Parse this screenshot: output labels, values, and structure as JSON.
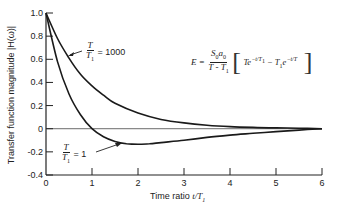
{
  "chart_data": {
    "type": "line",
    "title": "",
    "xlabel": "Time ratio t/T1",
    "ylabel": "Transfer function magnitude |H(ω)|",
    "xlim": [
      0,
      6
    ],
    "ylim": [
      -0.4,
      1.0
    ],
    "xticks": [
      0,
      1,
      2,
      3,
      4,
      5,
      6
    ],
    "yticks": [
      -0.4,
      -0.2,
      0,
      0.2,
      0.4,
      0.6,
      0.8,
      1.0
    ],
    "ytick_labels": [
      "-0.4",
      "-0.2",
      "0",
      "0.2",
      "0.4",
      "0.6",
      "0.8",
      "1.0"
    ],
    "grid": false,
    "zero_line": true,
    "series": [
      {
        "name": "T/T1 = 1000",
        "x": [
          0,
          0.25,
          0.5,
          0.75,
          1.0,
          1.25,
          1.5,
          2.0,
          2.5,
          3.0,
          3.5,
          4.0,
          4.5,
          5.0,
          5.5,
          6.0
        ],
        "values": [
          1.0,
          0.78,
          0.61,
          0.47,
          0.37,
          0.29,
          0.22,
          0.135,
          0.08,
          0.05,
          0.03,
          0.018,
          0.011,
          0.007,
          0.004,
          0.0
        ]
      },
      {
        "name": "T/T1 = 1",
        "x": [
          0,
          0.25,
          0.5,
          0.75,
          1.0,
          1.25,
          1.5,
          1.75,
          2.0,
          2.25,
          2.5,
          3.0,
          3.5,
          4.0,
          4.5,
          5.0,
          5.5,
          6.0
        ],
        "values": [
          1.0,
          0.58,
          0.3,
          0.12,
          0.0,
          -0.07,
          -0.11,
          -0.13,
          -0.135,
          -0.13,
          -0.12,
          -0.1,
          -0.075,
          -0.055,
          -0.04,
          -0.025,
          -0.012,
          0.0
        ]
      }
    ],
    "annotations": [
      {
        "text": "T/T1 = 1000",
        "points_to": "upper curve near t/T1 ≈ 0.6"
      },
      {
        "text": "T/T1 = 1",
        "points_to": "lower curve near t/T1 ≈ 1.7"
      },
      {
        "text": "E = (S0 a0 / (T - T1)) [ T e^(-t/T1) - T1 e^(-t/T) ]"
      }
    ]
  },
  "labels": {
    "ylabel": "Transfer function magnitude |H(ω)|",
    "xlabel_prefix": "Time ratio ",
    "xlabel_var": "t/T",
    "xlabel_sub": "1",
    "curve1": {
      "num": "T",
      "den": "T",
      "den_sub": "1",
      "eq": "= 1000"
    },
    "curve2": {
      "num": "T",
      "den": "T",
      "den_sub": "1",
      "eq": "= 1"
    },
    "formula": {
      "lhs": "E =",
      "num": "S",
      "num_sub1": "0",
      "num_mid": "a",
      "num_sub2": "0",
      "den": "T - T",
      "den_sub": "1",
      "term1": "Te",
      "term1_sup": "−t/T",
      "term1_sup_sub": "1",
      "minus": " − T",
      "term2_sub": "1",
      "term2": "e",
      "term2_sup": "−t/T"
    }
  }
}
